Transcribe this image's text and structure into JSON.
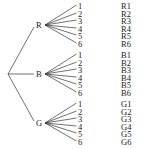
{
  "diagram": {
    "type": "tree-diagram",
    "root": {
      "x": 8,
      "y": 74
    },
    "branches": [
      {
        "label": "R",
        "node": {
          "x": 45,
          "y": 25
        },
        "leaves": [
          "1",
          "2",
          "3",
          "4",
          "5",
          "6"
        ],
        "outcomes": [
          "R1",
          "R2",
          "R3",
          "R4",
          "R5",
          "R6"
        ],
        "leaf_y": [
          6,
          14,
          21,
          29,
          36,
          44
        ]
      },
      {
        "label": "B",
        "node": {
          "x": 45,
          "y": 74
        },
        "leaves": [
          "1",
          "2",
          "3",
          "4",
          "5",
          "6"
        ],
        "outcomes": [
          "B1",
          "B2",
          "B3",
          "B4",
          "B5",
          "B6"
        ],
        "leaf_y": [
          55,
          63,
          70,
          78,
          85,
          93
        ]
      },
      {
        "label": "G",
        "node": {
          "x": 45,
          "y": 123
        },
        "leaves": [
          "1",
          "2",
          "3",
          "4",
          "5",
          "6"
        ],
        "outcomes": [
          "G1",
          "G2",
          "G3",
          "G4",
          "G5",
          "G6"
        ],
        "leaf_y": [
          104,
          112,
          119,
          127,
          134,
          142
        ]
      }
    ],
    "leaf_x": 78,
    "outcome_x": 121
  }
}
